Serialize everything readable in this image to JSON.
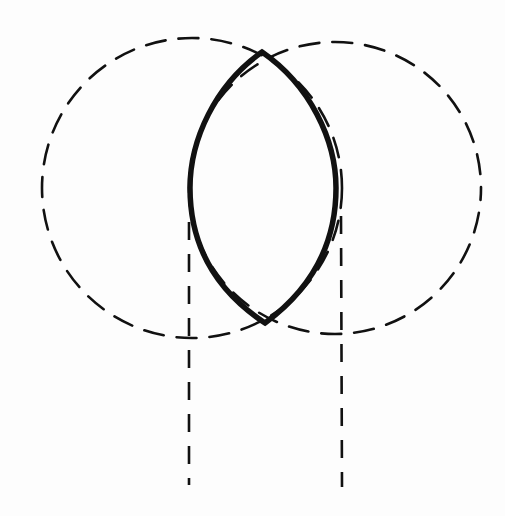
{
  "diagram": {
    "type": "geometric-construction",
    "colors": {
      "background": "#fdfdfd",
      "stroke": "#111111"
    },
    "circles": [
      {
        "name": "left-circle",
        "cx": 192,
        "cy": 188,
        "r": 150,
        "style": "dashed"
      },
      {
        "name": "right-circle",
        "cx": 335,
        "cy": 188,
        "r": 146,
        "style": "dashed"
      }
    ],
    "lens": {
      "top": [
        262,
        52
      ],
      "bottom": [
        265,
        323
      ],
      "left_extreme_x": 190,
      "right_extreme_x": 336,
      "style": "bold-solid"
    },
    "vertical_lines": [
      {
        "name": "left-vertical",
        "x": 189,
        "y1": 222,
        "y2": 485,
        "style": "dashed"
      },
      {
        "name": "right-vertical",
        "x": 341,
        "y1": 216,
        "y2": 487,
        "style": "dashed"
      }
    ],
    "labels": []
  }
}
